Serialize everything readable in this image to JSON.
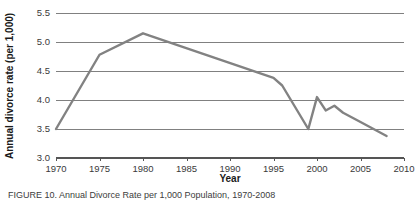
{
  "figure": {
    "caption_label": "FIGURE 10",
    "caption_text": "FIGURE 10. Annual Divorce Rate per 1,000 Population, 1970-2008"
  },
  "axes": {
    "y_title": "Annual divorce rate (per 1,000)",
    "x_title": "Year",
    "y_ticks": [
      "3.0",
      "3.5",
      "4.0",
      "4.5",
      "5.0",
      "5.5"
    ],
    "x_ticks": [
      "1970",
      "1975",
      "1980",
      "1985",
      "1990",
      "1995",
      "2000",
      "2005",
      "2010"
    ]
  },
  "colors": {
    "line": "#828282",
    "grid": "#808080",
    "axis": "#555555",
    "text": "#1a1a1a",
    "background": "#ffffff"
  },
  "chart_data": {
    "type": "line",
    "title": "",
    "xlabel": "Year",
    "ylabel": "Annual divorce rate (per 1,000)",
    "xlim": [
      1970,
      2010
    ],
    "ylim": [
      3.0,
      5.5
    ],
    "ytick_values": [
      3.0,
      3.5,
      4.0,
      4.5,
      5.0,
      5.5
    ],
    "xtick_values": [
      1970,
      1975,
      1980,
      1985,
      1990,
      1995,
      2000,
      2005,
      2010
    ],
    "grid": "horizontal",
    "legend": "none",
    "series": [
      {
        "name": "Annual divorce rate (per 1,000)",
        "color": "#828282",
        "x": [
          1970,
          1975,
          1980,
          1995,
          1996,
          1999,
          2000,
          2001,
          2002,
          2003,
          2005,
          2008
        ],
        "values": [
          3.5,
          4.78,
          5.15,
          4.38,
          4.25,
          3.5,
          4.05,
          3.82,
          3.9,
          3.78,
          3.62,
          3.38
        ]
      }
    ],
    "points": [
      {
        "year": 1970,
        "rate": 3.5
      },
      {
        "year": 1975,
        "rate": 4.78
      },
      {
        "year": 1980,
        "rate": 5.15
      },
      {
        "year": 1995,
        "rate": 4.38
      },
      {
        "year": 1996,
        "rate": 4.25
      },
      {
        "year": 1999,
        "rate": 3.5
      },
      {
        "year": 2000,
        "rate": 4.05
      },
      {
        "year": 2001,
        "rate": 3.82
      },
      {
        "year": 2002,
        "rate": 3.9
      },
      {
        "year": 2003,
        "rate": 3.78
      },
      {
        "year": 2005,
        "rate": 3.62
      },
      {
        "year": 2008,
        "rate": 3.38
      }
    ]
  }
}
